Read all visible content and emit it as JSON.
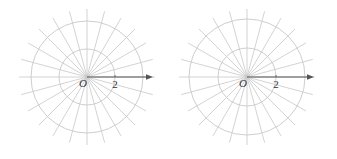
{
  "diagrams": [
    {
      "id": "left",
      "center": [
        87,
        77
      ],
      "unit_px": 14,
      "circles_r_units": [
        2,
        4
      ],
      "ray_step_deg": 15,
      "ray_length_px": 68,
      "axis_end_px": 153,
      "origin_label": "O",
      "tick_label": "2",
      "tick_value": 2
    },
    {
      "id": "right",
      "center": [
        247,
        77
      ],
      "unit_px": 14.5,
      "circles_r_units": [
        2,
        4
      ],
      "ray_step_deg": 15,
      "ray_length_px": 68,
      "axis_end_px": 314,
      "origin_label": "O",
      "tick_label": "2",
      "tick_value": 2
    }
  ],
  "colors": {
    "grid": "#c8c8c8",
    "axis": "#555555",
    "label": "#333333"
  }
}
